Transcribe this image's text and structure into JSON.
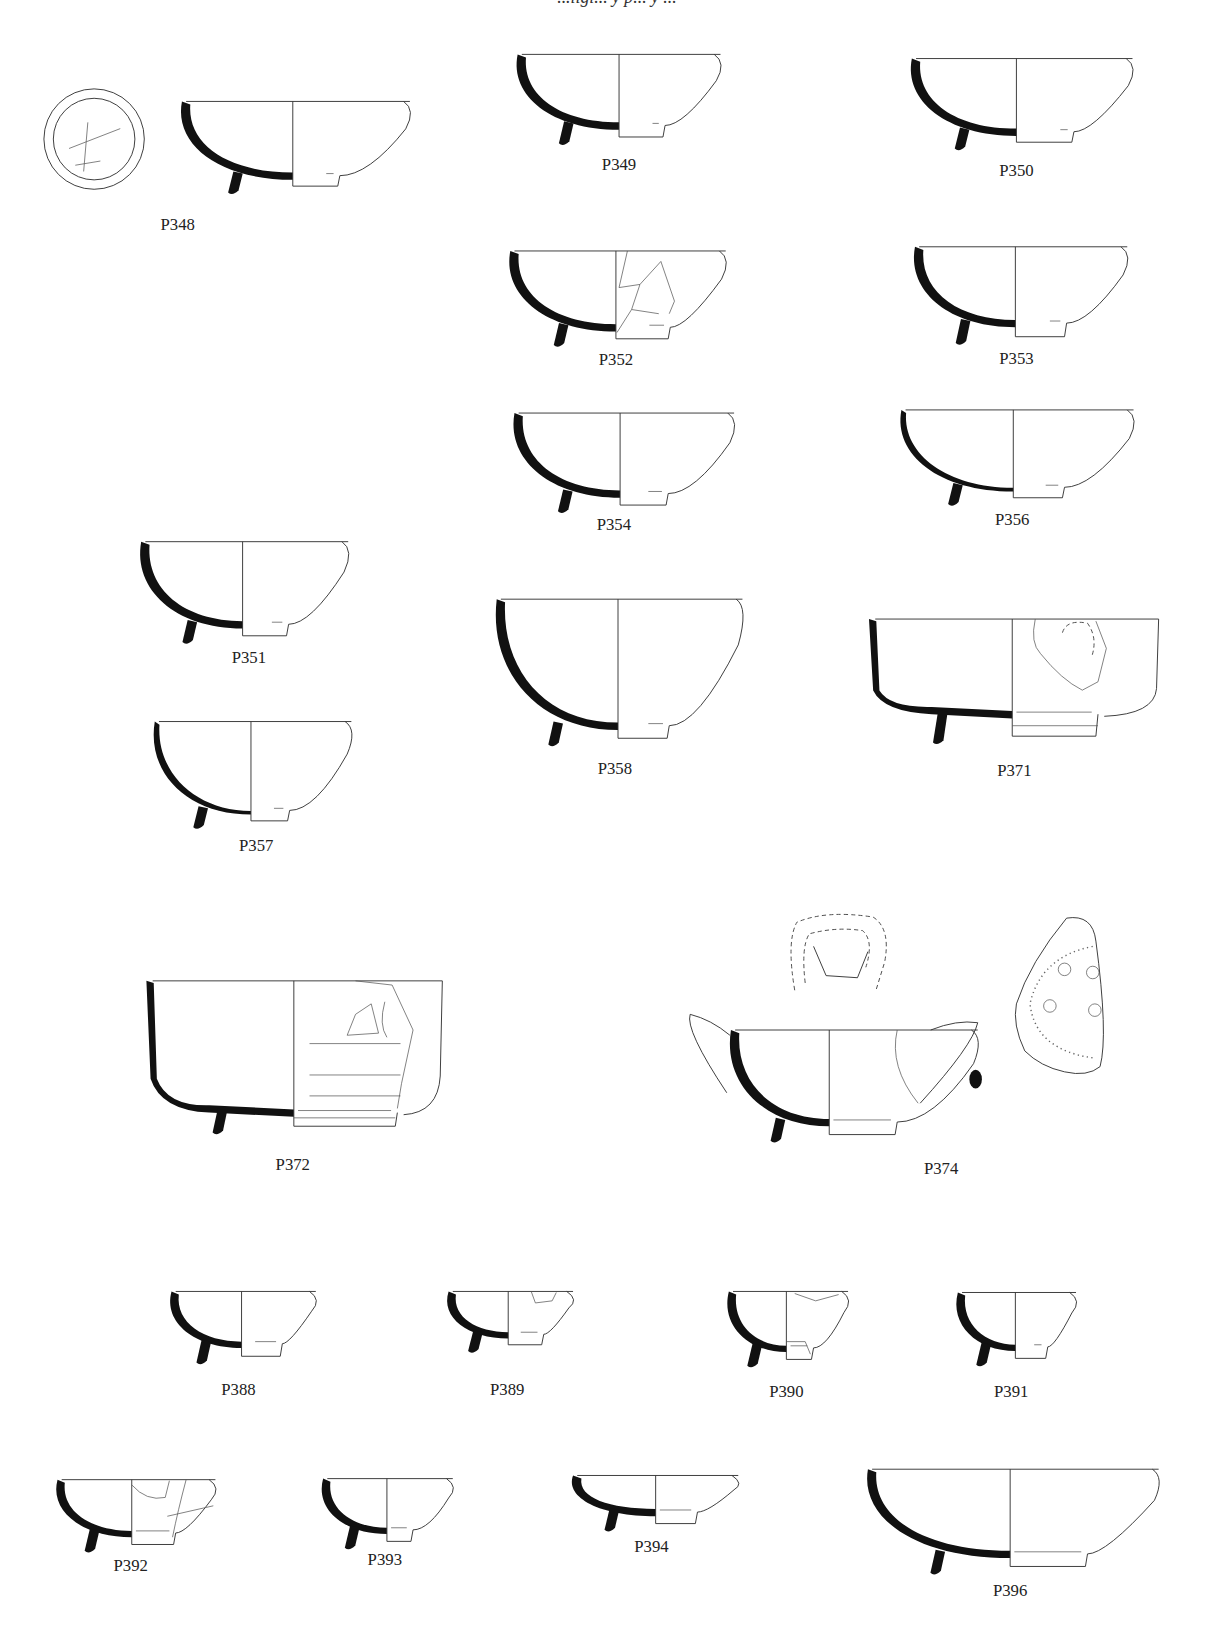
{
  "header": {
    "text": "...ligi... y p... y ..."
  },
  "figures": [
    {
      "id": "P348",
      "label": "P348",
      "kind": "bowl",
      "x0": 172,
      "x1": 392,
      "rim": 97,
      "foot": 172,
      "footY": 178,
      "cx": 280,
      "ring": [
        308,
        168,
        325
      ],
      "labelX": 170,
      "labelY": 220,
      "extras": [
        "plan348"
      ]
    },
    {
      "id": "P349",
      "label": "P349",
      "kind": "bowl",
      "x0": 493,
      "x1": 689,
      "rim": 52,
      "foot": 124,
      "footY": 131,
      "cx": 592,
      "ring": [
        620,
        123,
        636
      ],
      "labelX": 592,
      "labelY": 163
    },
    {
      "id": "P350",
      "label": "P350",
      "kind": "bowl",
      "x0": 870,
      "x1": 1083,
      "rim": 56,
      "foot": 130,
      "footY": 136,
      "cx": 972,
      "ring": [
        1010,
        127,
        1027
      ],
      "labelX": 972,
      "labelY": 168
    },
    {
      "id": "P352",
      "label": "P352",
      "kind": "bowl",
      "x0": 486,
      "x1": 694,
      "rim": 240,
      "foot": 317,
      "footY": 324,
      "cx": 589,
      "ring": [
        617,
        316,
        641
      ],
      "labelX": 589,
      "labelY": 349,
      "extras": [
        "frag352"
      ]
    },
    {
      "id": "P353",
      "label": "P353",
      "kind": "bowl",
      "x0": 873,
      "x1": 1078,
      "rim": 236,
      "foot": 313,
      "footY": 322,
      "cx": 971,
      "ring": [
        1000,
        312,
        1020
      ],
      "labelX": 972,
      "labelY": 348
    },
    {
      "id": "P354",
      "label": "P354",
      "kind": "bowl",
      "x0": 490,
      "x1": 702,
      "rim": 395,
      "foot": 476,
      "footY": 483,
      "cx": 593,
      "ring": [
        616,
        468,
        639
      ],
      "labelX": 587,
      "labelY": 507
    },
    {
      "id": "P356",
      "label": "P356",
      "kind": "bowl-thin",
      "x0": 860,
      "x1": 1084,
      "rim": 392,
      "foot": 470,
      "footY": 476,
      "cx": 969,
      "ring": [
        996,
        468,
        1018
      ],
      "labelX": 968,
      "labelY": 502
    },
    {
      "id": "P351",
      "label": "P351",
      "kind": "bowl",
      "x0": 133,
      "x1": 333,
      "rim": 518,
      "foot": 601,
      "footY": 608,
      "cx": 232,
      "ring": [
        256,
        600,
        276
      ],
      "labelX": 238,
      "labelY": 634
    },
    {
      "id": "P358",
      "label": "P358",
      "kind": "bowl-deep",
      "x0": 473,
      "x1": 710,
      "rim": 573,
      "foot": 698,
      "footY": 706,
      "cx": 591,
      "ring": [
        616,
        695,
        640
      ],
      "labelX": 588,
      "labelY": 740
    },
    {
      "id": "P371",
      "label": "P371",
      "kind": "bowl-straight",
      "x0": 831,
      "x1": 1108,
      "rim": 592,
      "foot": 687,
      "footY": 704,
      "cx": 968,
      "ring": [
        968,
        683,
        1050
      ],
      "labelX": 970,
      "labelY": 742,
      "extras": [
        "decor371"
      ]
    },
    {
      "id": "P357",
      "label": "P357",
      "kind": "bowl-thin",
      "x0": 146,
      "x1": 336,
      "rim": 690,
      "foot": 779,
      "footY": 785,
      "cx": 240,
      "ring": [
        258,
        777,
        277
      ],
      "labelX": 245,
      "labelY": 814
    },
    {
      "id": "P372",
      "label": "P372",
      "kind": "cup372",
      "x0": 140,
      "x1": 423,
      "rim": 938,
      "foot": 1068,
      "footY": 1077,
      "cx": 281,
      "ring": [
        281,
        1060,
        380
      ],
      "labelX": 280,
      "labelY": 1119,
      "extras": [
        "decor372"
      ]
    },
    {
      "id": "P374",
      "label": "P374",
      "kind": "jug374",
      "x0": 697,
      "x1": 935,
      "rim": 985,
      "foot": 1077,
      "footY": 1085,
      "cx": 793,
      "ring": [
        793,
        1068,
        858
      ],
      "labelX": 900,
      "labelY": 1123,
      "extras": [
        "handle374",
        "sherd374",
        "section374"
      ]
    },
    {
      "id": "P388",
      "label": "P388",
      "kind": "bowl-small",
      "x0": 162,
      "x1": 302,
      "rim": 1235,
      "foot": 1289,
      "footY": 1297,
      "cx": 231,
      "ring": [
        240,
        1287,
        270
      ],
      "labelX": 228,
      "labelY": 1334
    },
    {
      "id": "P389",
      "label": "P389",
      "kind": "bowl-small",
      "x0": 427,
      "x1": 548,
      "rim": 1235,
      "foot": 1280,
      "footY": 1286,
      "cx": 486,
      "ring": [
        494,
        1277,
        520
      ],
      "labelX": 485,
      "labelY": 1334,
      "extras": [
        "frag389"
      ]
    },
    {
      "id": "P390",
      "label": "P390",
      "kind": "bowl-small",
      "x0": 695,
      "x1": 811,
      "rim": 1235,
      "foot": 1293,
      "footY": 1300,
      "cx": 752,
      "ring": [
        752,
        1284,
        778
      ],
      "labelX": 752,
      "labelY": 1336,
      "extras": [
        "frag390"
      ]
    },
    {
      "id": "P391",
      "label": "P391",
      "kind": "bowl-small",
      "x0": 914,
      "x1": 1029,
      "rim": 1236,
      "foot": 1292,
      "footY": 1299,
      "cx": 971,
      "ring": [
        985,
        1283,
        1002
      ],
      "labelX": 967,
      "labelY": 1336
    },
    {
      "id": "P392",
      "label": "P392",
      "kind": "bowl-small",
      "x0": 53,
      "x1": 206,
      "rim": 1415,
      "foot": 1470,
      "footY": 1477,
      "cx": 126,
      "ring": [
        126,
        1465,
        168
      ],
      "labelX": 125,
      "labelY": 1502,
      "extras": [
        "frag392"
      ]
    },
    {
      "id": "P393",
      "label": "P393",
      "kind": "bowl-small",
      "x0": 307,
      "x1": 433,
      "rim": 1414,
      "foot": 1467,
      "footY": 1474,
      "cx": 370,
      "ring": [
        370,
        1462,
        395
      ],
      "labelX": 368,
      "labelY": 1497
    },
    {
      "id": "P394",
      "label": "P394",
      "kind": "bowl-shallow",
      "x0": 546,
      "x1": 706,
      "rim": 1411,
      "foot": 1450,
      "footY": 1457,
      "cx": 627,
      "ring": [
        627,
        1440,
        667
      ],
      "labelX": 623,
      "labelY": 1484
    },
    {
      "id": "P396",
      "label": "P396",
      "kind": "bowl-wide",
      "x0": 828,
      "x1": 1108,
      "rim": 1405,
      "foot": 1490,
      "footY": 1498,
      "cx": 966,
      "ring": [
        966,
        1474,
        1040
      ],
      "labelX": 966,
      "labelY": 1526
    }
  ]
}
